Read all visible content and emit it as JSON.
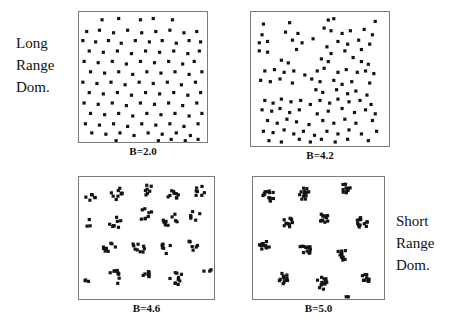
{
  "figure": {
    "left_label": {
      "lines": [
        "Long",
        "Range",
        "Dom."
      ]
    },
    "right_label": {
      "lines": [
        "Short",
        "Range",
        "Dom."
      ]
    },
    "dot_color": "#141414",
    "border_color": "#7b7b7b",
    "background": "#ffffff"
  },
  "panels": [
    {
      "id": "b20",
      "caption": "B=2.0"
    },
    {
      "id": "b42",
      "caption": "B=4.2"
    },
    {
      "id": "b46",
      "caption": "B=4.6"
    },
    {
      "id": "b50",
      "caption": "B=5.0"
    }
  ],
  "chart_data": [
    {
      "type": "scatter",
      "title": "B=2.0",
      "annotation": "Long Range Dom.",
      "xlabel": "",
      "ylabel": "",
      "xlim": [
        0,
        1
      ],
      "ylim": [
        0,
        1
      ],
      "grid": false,
      "legend": null,
      "marker": "square",
      "description": "Near-uniform quasi-regular lattice-like point distribution filling the box",
      "points": [
        [
          0.18,
          0.06
        ],
        [
          0.31,
          0.05
        ],
        [
          0.48,
          0.06
        ],
        [
          0.58,
          0.05
        ],
        [
          0.73,
          0.06
        ],
        [
          0.06,
          0.15
        ],
        [
          0.16,
          0.14
        ],
        [
          0.27,
          0.16
        ],
        [
          0.38,
          0.14
        ],
        [
          0.49,
          0.16
        ],
        [
          0.6,
          0.15
        ],
        [
          0.71,
          0.14
        ],
        [
          0.82,
          0.16
        ],
        [
          0.92,
          0.15
        ],
        [
          0.03,
          0.22
        ],
        [
          0.13,
          0.23
        ],
        [
          0.23,
          0.22
        ],
        [
          0.33,
          0.24
        ],
        [
          0.44,
          0.22
        ],
        [
          0.55,
          0.23
        ],
        [
          0.65,
          0.22
        ],
        [
          0.76,
          0.24
        ],
        [
          0.86,
          0.22
        ],
        [
          0.95,
          0.23
        ],
        [
          0.08,
          0.3
        ],
        [
          0.19,
          0.31
        ],
        [
          0.3,
          0.3
        ],
        [
          0.41,
          0.32
        ],
        [
          0.52,
          0.3
        ],
        [
          0.63,
          0.31
        ],
        [
          0.74,
          0.3
        ],
        [
          0.85,
          0.32
        ],
        [
          0.94,
          0.3
        ],
        [
          0.04,
          0.38
        ],
        [
          0.15,
          0.39
        ],
        [
          0.26,
          0.38
        ],
        [
          0.37,
          0.4
        ],
        [
          0.48,
          0.38
        ],
        [
          0.59,
          0.39
        ],
        [
          0.7,
          0.38
        ],
        [
          0.81,
          0.4
        ],
        [
          0.9,
          0.38
        ],
        [
          0.09,
          0.46
        ],
        [
          0.2,
          0.47
        ],
        [
          0.31,
          0.46
        ],
        [
          0.42,
          0.48
        ],
        [
          0.53,
          0.46
        ],
        [
          0.64,
          0.47
        ],
        [
          0.75,
          0.46
        ],
        [
          0.86,
          0.48
        ],
        [
          0.96,
          0.46
        ],
        [
          0.03,
          0.54
        ],
        [
          0.14,
          0.55
        ],
        [
          0.25,
          0.54
        ],
        [
          0.36,
          0.56
        ],
        [
          0.47,
          0.54
        ],
        [
          0.58,
          0.55
        ],
        [
          0.69,
          0.54
        ],
        [
          0.8,
          0.56
        ],
        [
          0.91,
          0.54
        ],
        [
          0.08,
          0.62
        ],
        [
          0.19,
          0.63
        ],
        [
          0.3,
          0.62
        ],
        [
          0.41,
          0.64
        ],
        [
          0.52,
          0.62
        ],
        [
          0.63,
          0.63
        ],
        [
          0.74,
          0.62
        ],
        [
          0.85,
          0.64
        ],
        [
          0.95,
          0.62
        ],
        [
          0.04,
          0.7
        ],
        [
          0.15,
          0.71
        ],
        [
          0.26,
          0.7
        ],
        [
          0.37,
          0.72
        ],
        [
          0.48,
          0.7
        ],
        [
          0.59,
          0.71
        ],
        [
          0.7,
          0.7
        ],
        [
          0.81,
          0.72
        ],
        [
          0.92,
          0.7
        ],
        [
          0.09,
          0.78
        ],
        [
          0.2,
          0.79
        ],
        [
          0.31,
          0.78
        ],
        [
          0.42,
          0.8
        ],
        [
          0.53,
          0.78
        ],
        [
          0.64,
          0.79
        ],
        [
          0.75,
          0.78
        ],
        [
          0.86,
          0.8
        ],
        [
          0.96,
          0.78
        ],
        [
          0.05,
          0.86
        ],
        [
          0.16,
          0.87
        ],
        [
          0.27,
          0.86
        ],
        [
          0.38,
          0.88
        ],
        [
          0.49,
          0.86
        ],
        [
          0.6,
          0.87
        ],
        [
          0.71,
          0.86
        ],
        [
          0.82,
          0.88
        ],
        [
          0.93,
          0.86
        ],
        [
          0.1,
          0.93
        ],
        [
          0.21,
          0.94
        ],
        [
          0.32,
          0.93
        ],
        [
          0.43,
          0.95
        ],
        [
          0.54,
          0.93
        ],
        [
          0.65,
          0.94
        ],
        [
          0.76,
          0.93
        ],
        [
          0.87,
          0.95
        ],
        [
          0.29,
          0.99
        ],
        [
          0.62,
          0.99
        ],
        [
          0.72,
          0.98
        ],
        [
          0.83,
          0.99
        ],
        [
          0.93,
          0.98
        ]
      ]
    },
    {
      "type": "scatter",
      "title": "B=4.2",
      "annotation": "",
      "xlabel": "",
      "ylabel": "",
      "xlim": [
        0,
        1
      ],
      "ylim": [
        0,
        1
      ],
      "grid": false,
      "legend": null,
      "marker": "square",
      "description": "Filamentary / loosely clustered distribution with voids",
      "points": [
        [
          0.09,
          0.09
        ],
        [
          0.28,
          0.08
        ],
        [
          0.56,
          0.06
        ],
        [
          0.6,
          0.05
        ],
        [
          0.9,
          0.07
        ],
        [
          0.08,
          0.17
        ],
        [
          0.25,
          0.15
        ],
        [
          0.34,
          0.16
        ],
        [
          0.53,
          0.12
        ],
        [
          0.58,
          0.14
        ],
        [
          0.66,
          0.16
        ],
        [
          0.72,
          0.14
        ],
        [
          0.82,
          0.13
        ],
        [
          0.88,
          0.17
        ],
        [
          0.06,
          0.23
        ],
        [
          0.12,
          0.22
        ],
        [
          0.3,
          0.21
        ],
        [
          0.37,
          0.23
        ],
        [
          0.45,
          0.2
        ],
        [
          0.63,
          0.22
        ],
        [
          0.7,
          0.24
        ],
        [
          0.78,
          0.21
        ],
        [
          0.86,
          0.24
        ],
        [
          0.06,
          0.29
        ],
        [
          0.12,
          0.3
        ],
        [
          0.33,
          0.28
        ],
        [
          0.55,
          0.26
        ],
        [
          0.58,
          0.31
        ],
        [
          0.68,
          0.29
        ],
        [
          0.8,
          0.28
        ],
        [
          0.22,
          0.36
        ],
        [
          0.27,
          0.38
        ],
        [
          0.51,
          0.35
        ],
        [
          0.56,
          0.37
        ],
        [
          0.74,
          0.34
        ],
        [
          0.8,
          0.37
        ],
        [
          0.85,
          0.39
        ],
        [
          0.1,
          0.44
        ],
        [
          0.17,
          0.43
        ],
        [
          0.24,
          0.45
        ],
        [
          0.31,
          0.44
        ],
        [
          0.39,
          0.47
        ],
        [
          0.48,
          0.44
        ],
        [
          0.53,
          0.42
        ],
        [
          0.63,
          0.45
        ],
        [
          0.69,
          0.43
        ],
        [
          0.77,
          0.45
        ],
        [
          0.83,
          0.44
        ],
        [
          0.89,
          0.46
        ],
        [
          0.07,
          0.51
        ],
        [
          0.14,
          0.52
        ],
        [
          0.21,
          0.5
        ],
        [
          0.3,
          0.53
        ],
        [
          0.44,
          0.5
        ],
        [
          0.5,
          0.52
        ],
        [
          0.6,
          0.51
        ],
        [
          0.66,
          0.54
        ],
        [
          0.73,
          0.52
        ],
        [
          0.86,
          0.53
        ],
        [
          0.47,
          0.58
        ],
        [
          0.52,
          0.6
        ],
        [
          0.62,
          0.58
        ],
        [
          0.7,
          0.61
        ],
        [
          0.76,
          0.59
        ],
        [
          0.84,
          0.62
        ],
        [
          0.1,
          0.66
        ],
        [
          0.16,
          0.68
        ],
        [
          0.22,
          0.65
        ],
        [
          0.29,
          0.67
        ],
        [
          0.36,
          0.66
        ],
        [
          0.43,
          0.69
        ],
        [
          0.5,
          0.66
        ],
        [
          0.57,
          0.68
        ],
        [
          0.63,
          0.65
        ],
        [
          0.71,
          0.67
        ],
        [
          0.79,
          0.66
        ],
        [
          0.87,
          0.69
        ],
        [
          0.08,
          0.73
        ],
        [
          0.15,
          0.74
        ],
        [
          0.21,
          0.72
        ],
        [
          0.28,
          0.75
        ],
        [
          0.35,
          0.73
        ],
        [
          0.48,
          0.76
        ],
        [
          0.56,
          0.74
        ],
        [
          0.66,
          0.72
        ],
        [
          0.75,
          0.75
        ],
        [
          0.83,
          0.73
        ],
        [
          0.9,
          0.76
        ],
        [
          0.12,
          0.81
        ],
        [
          0.19,
          0.83
        ],
        [
          0.26,
          0.8
        ],
        [
          0.33,
          0.82
        ],
        [
          0.42,
          0.84
        ],
        [
          0.52,
          0.81
        ],
        [
          0.6,
          0.83
        ],
        [
          0.68,
          0.8
        ],
        [
          0.76,
          0.83
        ],
        [
          0.88,
          0.81
        ],
        [
          0.09,
          0.89
        ],
        [
          0.16,
          0.9
        ],
        [
          0.24,
          0.88
        ],
        [
          0.31,
          0.91
        ],
        [
          0.38,
          0.89
        ],
        [
          0.46,
          0.92
        ],
        [
          0.55,
          0.89
        ],
        [
          0.63,
          0.91
        ],
        [
          0.71,
          0.88
        ],
        [
          0.8,
          0.91
        ],
        [
          0.91,
          0.89
        ],
        [
          0.13,
          0.96
        ],
        [
          0.22,
          0.97
        ],
        [
          0.35,
          0.95
        ],
        [
          0.43,
          0.97
        ],
        [
          0.51,
          0.95
        ],
        [
          0.61,
          0.97
        ],
        [
          0.7,
          0.95
        ],
        [
          0.85,
          0.96
        ]
      ]
    },
    {
      "type": "scatter",
      "title": "B=4.6",
      "annotation": "",
      "xlabel": "",
      "ylabel": "",
      "xlim": [
        0,
        1
      ],
      "ylim": [
        0,
        1
      ],
      "grid": false,
      "legend": null,
      "marker": "square",
      "description": "Distinct loose clumps of roughly 5-10 points separated by empty space",
      "clusters": [
        {
          "cx": 0.09,
          "cy": 0.17,
          "n": 6,
          "r": 0.045
        },
        {
          "cx": 0.28,
          "cy": 0.13,
          "n": 9,
          "r": 0.055
        },
        {
          "cx": 0.5,
          "cy": 0.1,
          "n": 7,
          "r": 0.045
        },
        {
          "cx": 0.7,
          "cy": 0.14,
          "n": 9,
          "r": 0.055
        },
        {
          "cx": 0.9,
          "cy": 0.12,
          "n": 7,
          "r": 0.045
        },
        {
          "cx": 0.06,
          "cy": 0.38,
          "n": 3,
          "r": 0.035
        },
        {
          "cx": 0.27,
          "cy": 0.36,
          "n": 8,
          "r": 0.055
        },
        {
          "cx": 0.49,
          "cy": 0.31,
          "n": 8,
          "r": 0.06
        },
        {
          "cx": 0.68,
          "cy": 0.35,
          "n": 10,
          "r": 0.065
        },
        {
          "cx": 0.86,
          "cy": 0.31,
          "n": 6,
          "r": 0.045
        },
        {
          "cx": 0.22,
          "cy": 0.58,
          "n": 8,
          "r": 0.05
        },
        {
          "cx": 0.44,
          "cy": 0.57,
          "n": 9,
          "r": 0.055
        },
        {
          "cx": 0.65,
          "cy": 0.58,
          "n": 7,
          "r": 0.048
        },
        {
          "cx": 0.84,
          "cy": 0.57,
          "n": 7,
          "r": 0.048
        },
        {
          "cx": 0.05,
          "cy": 0.86,
          "n": 3,
          "r": 0.03
        },
        {
          "cx": 0.27,
          "cy": 0.82,
          "n": 11,
          "r": 0.06
        },
        {
          "cx": 0.5,
          "cy": 0.8,
          "n": 8,
          "r": 0.03
        },
        {
          "cx": 0.72,
          "cy": 0.83,
          "n": 10,
          "r": 0.055
        },
        {
          "cx": 0.95,
          "cy": 0.77,
          "n": 3,
          "r": 0.03
        }
      ]
    },
    {
      "type": "scatter",
      "title": "B=5.0",
      "annotation": "Short Range Dom.",
      "xlabel": "",
      "ylabel": "",
      "xlim": [
        0,
        1
      ],
      "ylim": [
        0,
        1
      ],
      "grid": false,
      "legend": null,
      "marker": "square",
      "description": "Tight compact well-separated clusters of ~10-14 points each",
      "clusters": [
        {
          "cx": 0.12,
          "cy": 0.16,
          "n": 13,
          "r": 0.048
        },
        {
          "cx": 0.4,
          "cy": 0.14,
          "n": 13,
          "r": 0.048
        },
        {
          "cx": 0.7,
          "cy": 0.09,
          "n": 11,
          "r": 0.042
        },
        {
          "cx": 0.26,
          "cy": 0.37,
          "n": 11,
          "r": 0.042
        },
        {
          "cx": 0.55,
          "cy": 0.34,
          "n": 12,
          "r": 0.045
        },
        {
          "cx": 0.84,
          "cy": 0.37,
          "n": 13,
          "r": 0.048
        },
        {
          "cx": 0.09,
          "cy": 0.56,
          "n": 12,
          "r": 0.045
        },
        {
          "cx": 0.4,
          "cy": 0.59,
          "n": 13,
          "r": 0.048
        },
        {
          "cx": 0.68,
          "cy": 0.64,
          "n": 12,
          "r": 0.045
        },
        {
          "cx": 0.24,
          "cy": 0.83,
          "n": 12,
          "r": 0.045
        },
        {
          "cx": 0.53,
          "cy": 0.87,
          "n": 13,
          "r": 0.048
        },
        {
          "cx": 0.86,
          "cy": 0.84,
          "n": 10,
          "r": 0.04
        },
        {
          "cx": 0.72,
          "cy": 0.98,
          "n": 2,
          "r": 0.015
        }
      ]
    }
  ]
}
